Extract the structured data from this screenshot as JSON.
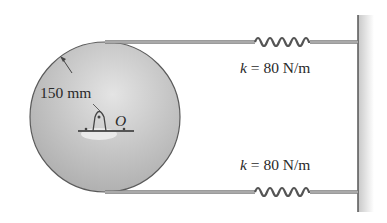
{
  "figure": {
    "radius_label": "150 mm",
    "pivot_label": "O",
    "springs": [
      {
        "k_symbol": "k",
        "k_text": " = 80 N/m"
      },
      {
        "k_symbol": "k",
        "k_text": " = 80 N/m"
      }
    ]
  },
  "colors": {
    "disk_fill": "#c4c4c4",
    "disk_edge": "#5a5a5a",
    "cable": "#7a7a7a",
    "spring": "#555555",
    "wall": "#d0d0d0",
    "text": "#2a2a2a"
  }
}
